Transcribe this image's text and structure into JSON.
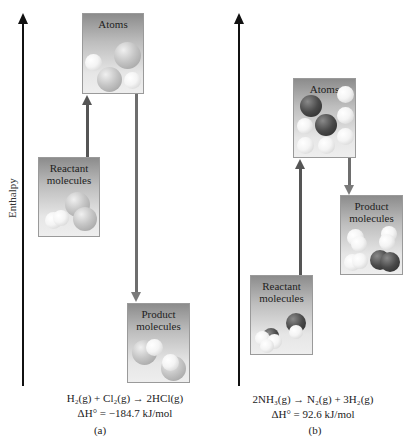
{
  "y_axis_label": "Enthalpy",
  "panel_a": {
    "caption": "(a)",
    "atoms_label": "Atoms",
    "reactant_label_1": "Reactant",
    "reactant_label_2": "molecules",
    "product_label_1": "Product",
    "product_label_2": "molecules",
    "equation": "H₂(g) + Cl₂(g) → 2HCl(g)",
    "delta_h": "ΔH° = −184.7 kJ/mol",
    "arrow_up_color": "#555555",
    "arrow_down_color": "#7a7a7a"
  },
  "panel_b": {
    "caption": "(b)",
    "atoms_label": "Atoms",
    "reactant_label_1": "Reactant",
    "reactant_label_2": "molecules",
    "product_label_1": "Product",
    "product_label_2": "molecules",
    "equation": "2NH₃(g) → N₂(g) + 3H₂(g)",
    "delta_h": "ΔH° = 92.6 kJ/mol"
  }
}
